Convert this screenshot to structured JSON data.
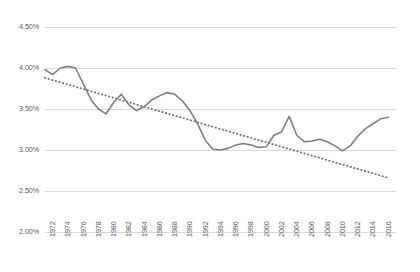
{
  "chart_data": {
    "type": "line",
    "title": "",
    "subtitle": "",
    "xlabel": "",
    "ylabel": "",
    "ylim": [
      0.02,
      0.045
    ],
    "xlim": [
      1972,
      2018
    ],
    "grid": true,
    "legend": "none",
    "y_tick_labels": [
      "4.50%",
      "4.00%",
      "3.50%",
      "3.00%",
      "2.50%",
      "2.00%"
    ],
    "y_tick_values": [
      0.045,
      0.04,
      0.035,
      0.03,
      0.025,
      0.02
    ],
    "x_tick_labels": [
      "1972",
      "1974",
      "1976",
      "1978",
      "1980",
      "1982",
      "1984",
      "1986",
      "1988",
      "1990",
      "1992",
      "1994",
      "1996",
      "1998",
      "2000",
      "2002",
      "2004",
      "2006",
      "2008",
      "2010",
      "2012",
      "2014",
      "2016"
    ],
    "x_tick_values": [
      1972,
      1974,
      1976,
      1978,
      1980,
      1982,
      1984,
      1986,
      1988,
      1990,
      1992,
      1994,
      1996,
      1998,
      2000,
      2002,
      2004,
      2006,
      2008,
      2010,
      2012,
      2014,
      2016
    ],
    "x": [
      1972,
      1973,
      1974,
      1975,
      1976,
      1977,
      1978,
      1979,
      1980,
      1981,
      1982,
      1983,
      1984,
      1985,
      1986,
      1987,
      1988,
      1989,
      1990,
      1991,
      1992,
      1993,
      1994,
      1995,
      1996,
      1997,
      1998,
      1999,
      2000,
      2001,
      2002,
      2003,
      2004,
      2005,
      2006,
      2007,
      2008,
      2009,
      2010,
      2011,
      2012,
      2013,
      2014,
      2015,
      2016,
      2017
    ],
    "series": [
      {
        "name": "Rate",
        "style": "solid",
        "color": "#7f7f7f",
        "values": [
          0.0398,
          0.0392,
          0.04,
          0.0402,
          0.04,
          0.0381,
          0.0362,
          0.035,
          0.0344,
          0.0358,
          0.0368,
          0.0355,
          0.0348,
          0.0353,
          0.0361,
          0.0366,
          0.037,
          0.0368,
          0.036,
          0.0348,
          0.0332,
          0.0312,
          0.0301,
          0.03,
          0.0302,
          0.0306,
          0.0308,
          0.0306,
          0.0303,
          0.0304,
          0.0318,
          0.0322,
          0.0341,
          0.0318,
          0.031,
          0.0311,
          0.0313,
          0.031,
          0.0305,
          0.0299,
          0.0305,
          0.0317,
          0.0326,
          0.0332,
          0.0338,
          0.034
        ],
        "values_note": "solid line: US/OECD-style declining rate series, 1972-2017"
      },
      {
        "name": "Linear trend",
        "style": "dotted",
        "color": "#6e6e6e",
        "endpoints": [
          {
            "x": 1972,
            "y": 0.0388
          },
          {
            "x": 2017,
            "y": 0.0266
          }
        ]
      }
    ],
    "colors": {
      "line": "#7f7f7f",
      "trend": "#6e6e6e",
      "grid": "#d9d9d9",
      "axis_text": "#5a5a5a",
      "background": "#ffffff"
    }
  }
}
